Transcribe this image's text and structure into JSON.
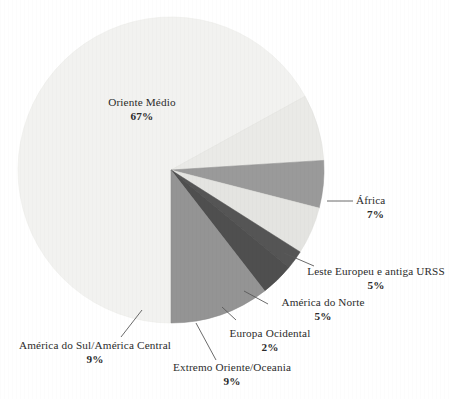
{
  "chart_data": {
    "type": "pie",
    "title": "",
    "subtitle": "",
    "xlabel": "",
    "ylabel": "",
    "legend_position": "none",
    "grid": false,
    "units": "percent",
    "total": 104,
    "categories": [
      "Oriente Médio",
      "África",
      "Leste Europeu e antiga URSS",
      "América do Norte",
      "Europa Ocidental",
      "Extremo Oriente/Oceania",
      "América do Sul/América Central"
    ],
    "values": [
      67,
      7,
      5,
      5,
      2,
      9,
      9
    ],
    "value_labels": [
      "67%",
      "7%",
      "5%",
      "5%",
      "2%",
      "9%",
      "9%"
    ],
    "colors": [
      "#f2f2f0",
      "#eaeae7",
      "#9a9a9a",
      "#e4e4e1",
      "#555555",
      "#4f4f4f",
      "#949494"
    ],
    "slices": [
      {
        "name": "Oriente Médio",
        "value": 67,
        "value_label": "67%",
        "color": "#f2f2f0",
        "start_deg": 90,
        "end_deg": 331.2,
        "leader": false
      },
      {
        "name": "África",
        "value": 7,
        "value_label": "7%",
        "color": "#eaeae7",
        "start_deg": 331.2,
        "end_deg": 356.4,
        "leader": true
      },
      {
        "name": "Leste Europeu e antiga URSS",
        "value": 5,
        "value_label": "5%",
        "color": "#9a9a9a",
        "start_deg": 356.4,
        "end_deg": 14.4,
        "leader": true
      },
      {
        "name": "América do Norte",
        "value": 5,
        "value_label": "5%",
        "color": "#e4e4e1",
        "start_deg": 14.4,
        "end_deg": 32.4,
        "leader": true
      },
      {
        "name": "Europa Ocidental",
        "value": 2,
        "value_label": "2%",
        "color": "#555555",
        "start_deg": 32.4,
        "end_deg": 39.6,
        "leader": true
      },
      {
        "name": "Extremo Oriente/Oceania",
        "value": 9,
        "value_label": "9%",
        "color": "#4f4f4f",
        "start_deg": 39.6,
        "end_deg": 52.2,
        "leader": true
      },
      {
        "name": "América do Sul/América Central",
        "value": 9,
        "value_label": "9%",
        "color": "#949494",
        "start_deg": 52.2,
        "end_deg": 90,
        "leader": true
      }
    ]
  },
  "labels": {
    "oriente_medio": {
      "name": "Oriente Médio",
      "pct": "67%"
    },
    "africa": {
      "name": "África",
      "pct": "7%"
    },
    "leste_europeu": {
      "name": "Leste Europeu e antiga URSS",
      "pct": "5%"
    },
    "america_norte": {
      "name": "América do Norte",
      "pct": "5%"
    },
    "europa_ocidental": {
      "name": "Europa Ocidental",
      "pct": "2%"
    },
    "extremo_oriente": {
      "name": "Extremo Oriente/Oceania",
      "pct": "9%"
    },
    "america_sul": {
      "name": "América do Sul/América Central",
      "pct": "9%"
    }
  },
  "style": {
    "background": "#ffffff",
    "text_color": "#2b2b2b",
    "leader_color": "#5a5a5a"
  }
}
